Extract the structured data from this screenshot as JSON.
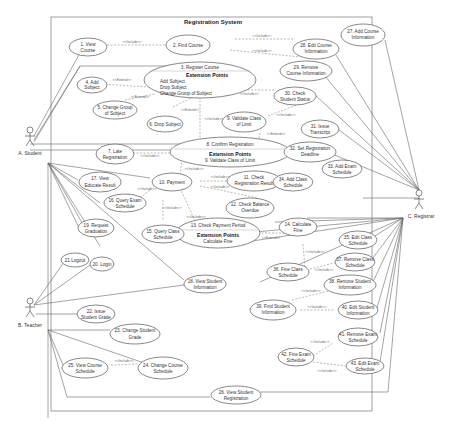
{
  "system": {
    "title": "Registration System"
  },
  "actors": [
    {
      "id": "A",
      "label": "A. Student"
    },
    {
      "id": "B",
      "label": "B. Teacher"
    },
    {
      "id": "C",
      "label": "C. Registrar"
    }
  ],
  "use_cases": {
    "uc1": [
      "1. View",
      "Course"
    ],
    "uc2": [
      "2. Find Course"
    ],
    "uc3": {
      "title": "3. Register Course",
      "ext_heading": "Extension Points",
      "ext": [
        "Add Subject",
        "Drop Subject",
        "Change Group of Subject"
      ]
    },
    "uc4": [
      "4. Add",
      "Subject"
    ],
    "uc5": [
      "5. Change Group",
      "of Subject"
    ],
    "uc6": [
      "6. Drop Subject"
    ],
    "uc7": [
      "7. Late",
      "Registration"
    ],
    "uc8": {
      "title": "8. Confirm Registration",
      "ext_heading": "Extension Points",
      "ext": [
        "9. Validate Class of Limit"
      ]
    },
    "uc9": [
      "9. Validate Class",
      "of Limit"
    ],
    "uc10": [
      "10. Payment"
    ],
    "uc11": [
      "11. Check",
      "Registration Result"
    ],
    "uc12": [
      "12. Check Balance",
      "Overdue"
    ],
    "uc13": {
      "title": "13. Check Payment Period",
      "ext_heading": "Extension Points",
      "ext": [
        "Calculate Fine"
      ]
    },
    "uc14": [
      "14. Calculate",
      "Fine"
    ],
    "uc15": [
      "15. Query Class",
      "Schedule"
    ],
    "uc16": [
      "16. Query Exam",
      "Schedule"
    ],
    "uc17": [
      "17. View",
      "Educate Result"
    ],
    "uc18": [
      "18. View Student",
      "Information"
    ],
    "uc19": [
      "19. Request",
      "Graduation"
    ],
    "uc20": [
      "20. Login"
    ],
    "uc21": [
      "21.Logout"
    ],
    "uc22": [
      "22. Issue",
      "Student Grade"
    ],
    "uc23": [
      "23. Change  Student",
      "Grade"
    ],
    "uc24": [
      "24. Change Course",
      "Schedule"
    ],
    "uc25": [
      "25. View Course",
      "Schedule"
    ],
    "uc26": [
      "26. View Student",
      "Registration"
    ],
    "uc27": [
      "27. Add Course",
      "Information"
    ],
    "uc28": [
      "28. Edit Course",
      "Information"
    ],
    "uc29": [
      "29. Remove",
      "Course Information"
    ],
    "uc30": [
      "30. Check",
      "Student Status"
    ],
    "uc31": [
      "31. Issue",
      "Transcript"
    ],
    "uc32": [
      "32. Set Registration",
      "Deadline"
    ],
    "uc33": [
      "33. Add Exam",
      "Schedule"
    ],
    "uc34": [
      "34. Add  Class",
      "Schedule"
    ],
    "uc35": [
      "35. Edit Class",
      "Schedule"
    ],
    "uc36": [
      "36. Fine Class",
      "Schedule"
    ],
    "uc37": [
      "37. Remove Class",
      "Schedule"
    ],
    "uc38": [
      "38. Remove Student",
      "Information"
    ],
    "uc39": [
      "39. Find Student",
      "Information"
    ],
    "uc40": [
      "40. Edit Student",
      "Information"
    ],
    "uc41": [
      "41. Remove Exam",
      "Schedule"
    ],
    "uc42": [
      "42. Fine Exam",
      "Schedule"
    ],
    "uc43": [
      "43. Edit Exam",
      "Schedule"
    ]
  },
  "stereotypes": {
    "include": "<<Include>>",
    "extend": "<<Extend>>"
  }
}
